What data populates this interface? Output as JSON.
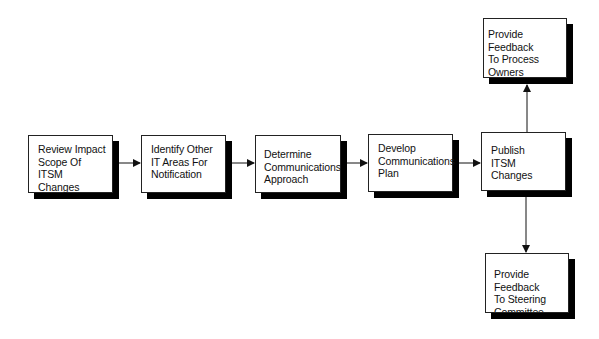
{
  "diagram": {
    "type": "flowchart",
    "nodes": [
      {
        "id": "review",
        "label": "Review Impact\nScope Of\nITSM\nChanges"
      },
      {
        "id": "identify",
        "label": "Identify Other\nIT Areas For\nNotification"
      },
      {
        "id": "determine",
        "label": "Determine\nCommunications\nApproach"
      },
      {
        "id": "develop",
        "label": "Develop\nCommunications\nPlan"
      },
      {
        "id": "publish",
        "label": "Publish\nITSM\nChanges"
      },
      {
        "id": "feedback_process",
        "label": "Provide Feedback\nTo Process\nOwners"
      },
      {
        "id": "feedback_steering",
        "label": "Provide Feedback\nTo Steering\nCommittee"
      }
    ],
    "edges": [
      {
        "from": "review",
        "to": "identify"
      },
      {
        "from": "identify",
        "to": "determine"
      },
      {
        "from": "determine",
        "to": "develop"
      },
      {
        "from": "develop",
        "to": "publish"
      },
      {
        "from": "publish",
        "to": "feedback_process"
      },
      {
        "from": "publish",
        "to": "feedback_steering"
      }
    ]
  }
}
